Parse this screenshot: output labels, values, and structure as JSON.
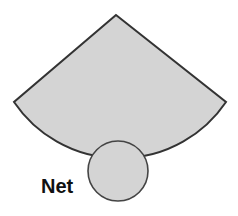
{
  "diagram": {
    "caption_cut_off": "",
    "shapes": [
      {
        "type": "sector",
        "fill": "#d4d4d4",
        "stroke": "#333333",
        "apex": [
          116,
          15
        ],
        "left_tip": [
          14,
          102
        ],
        "right_tip": [
          226,
          102
        ],
        "arc_bottom_y": 141
      },
      {
        "type": "circle",
        "fill": "#d4d4d4",
        "stroke": "#444444",
        "center": [
          118,
          171
        ],
        "radius": 30
      }
    ],
    "label": "Net"
  }
}
